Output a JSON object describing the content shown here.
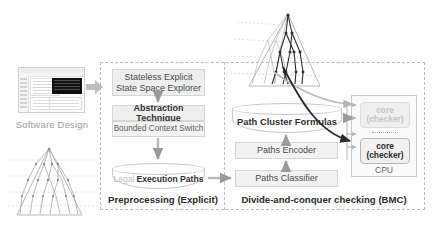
{
  "figure": {
    "left_input": {
      "thumbnail_name": "software-design-screenshot",
      "label": "Software Design"
    },
    "stages": {
      "preprocessing": {
        "caption": "Preprocessing (Explicit)",
        "explorer": "Stateless Explicit State Space Explorer",
        "explorer_line1": "Stateless Explicit",
        "explorer_line2": "State Space Explorer",
        "abstraction": "Abstraction Technique",
        "bounded": "Bounded Context Switch",
        "legal_soft": "Legal",
        "legal_hard": "Execution Paths"
      },
      "checking": {
        "caption": "Divide-and-conquer checking (BMC)",
        "formulas": "Path Cluster Formulas",
        "encoder": "Paths Encoder",
        "classifier": "Paths Classifier"
      }
    },
    "cpu": {
      "label": "CPU",
      "cores": [
        {
          "line1": "core",
          "line2": "(checker)",
          "state": "inactive"
        },
        {
          "line1": "core",
          "line2": "(checker)",
          "state": "active"
        }
      ]
    },
    "trees": {
      "top_tree_name": "execution-path-tree-highlighted",
      "bottom_tree_name": "execution-path-tree-plain"
    },
    "colors": {
      "box_fill": "#eeeeee",
      "box_border": "#d6d6d6",
      "dashed_border": "#b9b9b9",
      "arrow_grey": "#b4b4b4",
      "arrow_dark": "#2b2b2b",
      "muted_text": "#9b9b9b",
      "dark_text": "#2b2b2b"
    }
  }
}
